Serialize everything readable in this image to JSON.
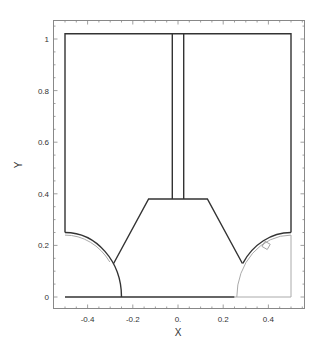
{
  "chart_data": {
    "type": "line",
    "title": "",
    "xlabel": "X",
    "ylabel": "Y",
    "xlim": [
      -0.54,
      0.56
    ],
    "ylim": [
      -0.04,
      1.08
    ],
    "grid": false,
    "legend": null,
    "x_ticks": [
      -0.4,
      -0.2,
      0.0,
      0.2,
      0.4
    ],
    "x_tick_labels": [
      "-0.4",
      "-0.2",
      "0.",
      "0.2",
      "0.4"
    ],
    "y_ticks": [
      0,
      0.2,
      0.4,
      0.6,
      0.8,
      1
    ],
    "y_tick_labels": [
      "0",
      "0.2",
      "0.4",
      "0.6",
      "0.8",
      "1"
    ],
    "series": [
      {
        "name": "outer-boundary",
        "color": "#333333",
        "points": [
          [
            -0.5,
            0.25
          ],
          [
            -0.5,
            1.02
          ],
          [
            0.5,
            1.02
          ],
          [
            0.5,
            0.25
          ]
        ]
      },
      {
        "name": "central-column-left",
        "color": "#333333",
        "points": [
          [
            -0.025,
            1.02
          ],
          [
            -0.025,
            0.38
          ]
        ]
      },
      {
        "name": "central-column-right",
        "color": "#333333",
        "points": [
          [
            0.025,
            1.02
          ],
          [
            0.025,
            0.38
          ]
        ]
      },
      {
        "name": "trapezoid",
        "color": "#333333",
        "points": [
          [
            -0.285,
            0.13
          ],
          [
            -0.13,
            0.38
          ],
          [
            0.13,
            0.38
          ],
          [
            0.285,
            0.13
          ]
        ]
      },
      {
        "name": "bottom-edge",
        "color": "#333333",
        "points": [
          [
            -0.5,
            0.0
          ],
          [
            0.25,
            0.0
          ]
        ]
      },
      {
        "name": "bottom-edge-right-gray",
        "color": "#aaaaaa",
        "points": [
          [
            0.25,
            0.0
          ],
          [
            0.5,
            0.0
          ],
          [
            0.5,
            0.24
          ]
        ]
      },
      {
        "name": "left-arc-outer",
        "color": "#333333",
        "shape": "quarter-circle",
        "center": [
          -0.5,
          0.0
        ],
        "radius": 0.25
      },
      {
        "name": "left-arc-inner",
        "color": "#aaaaaa",
        "shape": "partial-arc",
        "center": [
          -0.5,
          0.0
        ],
        "radius": 0.24
      },
      {
        "name": "right-arc-outer",
        "color": "#333333",
        "shape": "partial-arc",
        "center": [
          0.5,
          0.0
        ],
        "radius": 0.25
      },
      {
        "name": "right-arc-inner",
        "color": "#aaaaaa",
        "shape": "quarter-circle",
        "center": [
          0.5,
          0.0
        ],
        "radius": 0.24
      }
    ],
    "annotations": [
      {
        "type": "small-square-marker",
        "x": 0.39,
        "y": 0.2
      }
    ]
  },
  "colors": {
    "line_dark": "#333333",
    "line_light": "#aaaaaa",
    "frame": "#888888",
    "background": "#ffffff"
  }
}
